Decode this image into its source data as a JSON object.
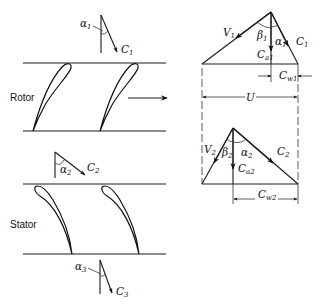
{
  "diagram": {
    "labels": {
      "rotor": "Rotor",
      "stator": "Stator"
    },
    "cascade_vectors": [
      {
        "name": "inlet",
        "angle": "α",
        "angle_sub": "1",
        "velocity": "C",
        "velocity_sub": "1"
      },
      {
        "name": "interstage",
        "angle": "α",
        "angle_sub": "2",
        "velocity": "C",
        "velocity_sub": "2"
      },
      {
        "name": "outlet",
        "angle": "α",
        "angle_sub": "3",
        "velocity": "C",
        "velocity_sub": "3"
      }
    ],
    "blade_motion_arrow": "blade-velocity-direction",
    "triangle_1": {
      "relative_velocity": {
        "sym": "V",
        "sub": "1"
      },
      "absolute_velocity": {
        "sym": "C",
        "sub": "1"
      },
      "relative_angle": {
        "sym": "β",
        "sub": "1"
      },
      "absolute_angle": {
        "sym": "α",
        "sub": "1"
      },
      "axial_component": {
        "sym": "C",
        "sub": "a1"
      },
      "whirl_component": {
        "sym": "C",
        "sub": "w1"
      }
    },
    "blade_speed": {
      "sym": "U"
    },
    "triangle_2": {
      "relative_velocity": {
        "sym": "V",
        "sub": "2"
      },
      "absolute_velocity": {
        "sym": "C",
        "sub": "2"
      },
      "relative_angle": {
        "sym": "β",
        "sub": "2"
      },
      "absolute_angle": {
        "sym": "α",
        "sub": "2"
      },
      "axial_component": {
        "sym": "C",
        "sub": "a2"
      },
      "whirl_component": {
        "sym": "C",
        "sub": "w2"
      }
    },
    "colors": {
      "line": "#1a1a1a",
      "background": "#ffffff"
    }
  }
}
